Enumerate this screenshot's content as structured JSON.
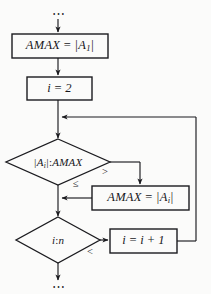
{
  "diagram": {
    "type": "flowchart",
    "canvas": {
      "width": 211,
      "height": 294,
      "background": "#fbfbfa"
    },
    "stroke_color": "#1b1b1f",
    "text_color": "#16161a"
  },
  "nodes": {
    "top_ellipsis": {
      "label": "⋯",
      "shape": "ellipsis",
      "x": 58,
      "y": 14
    },
    "init_amax": {
      "shape": "process",
      "text_html": "AMAX <span class=\"op\">=</span> |A<span class=\"sub\">1</span>|",
      "text_plain": "AMAX = |A1|",
      "x": 12,
      "y": 34,
      "w": 96,
      "h": 24
    },
    "init_i": {
      "shape": "process",
      "text_html": "i <span class=\"op\">=</span> 2",
      "text_plain": "i = 2",
      "x": 27,
      "y": 77,
      "w": 65,
      "h": 23
    },
    "compare_abs": {
      "shape": "decision",
      "text_html": "|A<span class=\"sub\">i</span>|<span class=\"op\">:</span>AMAX",
      "text_plain": "|Ai|:AMAX",
      "cx": 58,
      "cy": 162,
      "rx": 52,
      "ry": 23
    },
    "set_amax": {
      "shape": "process",
      "text_html": "AMAX <span class=\"op\">=</span> |A<span class=\"sub\">i</span>|",
      "text_plain": "AMAX = |Ai|",
      "x": 92,
      "y": 186,
      "w": 97,
      "h": 24
    },
    "compare_in": {
      "shape": "decision",
      "text_html": "i<span class=\"op\">:</span>n",
      "text_plain": "i:n",
      "cx": 58,
      "cy": 240,
      "rx": 42,
      "ry": 23
    },
    "increment_i": {
      "shape": "process",
      "text_html": "i <span class=\"op\">=</span> i <span class=\"op\">+</span> 1",
      "text_plain": "i = i + 1",
      "x": 110,
      "y": 229,
      "w": 67,
      "h": 24
    },
    "bottom_ellipsis": {
      "label": "⋯",
      "shape": "ellipsis",
      "x": 58,
      "y": 285
    }
  },
  "branch_labels": {
    "greater_than": {
      "text": ">",
      "x": 106,
      "y": 172
    },
    "less_equal": {
      "text": "≤",
      "x": 77,
      "y": 184
    },
    "less_than": {
      "text": "<",
      "x": 91,
      "y": 252
    }
  },
  "edges": [
    {
      "name": "ellipsis-to-init-amax",
      "from": "top_ellipsis",
      "to": "init_amax",
      "label": ""
    },
    {
      "name": "init-amax-to-init-i",
      "from": "init_amax",
      "to": "init_i",
      "label": ""
    },
    {
      "name": "init-i-to-merge",
      "from": "init_i",
      "to": "compare_abs",
      "label": ""
    },
    {
      "name": "compare-abs-greater-to-set-amax",
      "from": "compare_abs",
      "to": "set_amax",
      "label": ">"
    },
    {
      "name": "compare-abs-lessequal-to-compare-in",
      "from": "compare_abs",
      "to": "compare_in",
      "label": "≤"
    },
    {
      "name": "set-amax-to-compare-in",
      "from": "set_amax",
      "to": "compare_in",
      "label": ""
    },
    {
      "name": "compare-in-less-to-increment",
      "from": "compare_in",
      "to": "increment_i",
      "label": "<"
    },
    {
      "name": "increment-loopback-to-compare-abs",
      "from": "increment_i",
      "to": "compare_abs",
      "label": ""
    },
    {
      "name": "compare-in-to-bottom-ellipsis",
      "from": "compare_in",
      "to": "bottom_ellipsis",
      "label": ""
    }
  ]
}
